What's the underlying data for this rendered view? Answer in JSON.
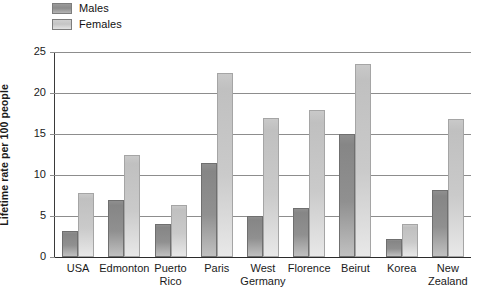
{
  "legend": {
    "position": "top-left",
    "items": [
      {
        "label": "Males",
        "color": "#8c8c8c",
        "icon": "legend-swatch-icon"
      },
      {
        "label": "Females",
        "color": "#c8c8c8",
        "icon": "legend-swatch-icon"
      }
    ]
  },
  "axis": {
    "ylabel": "Lifetime rate per 100 people",
    "yticks": [
      "0",
      "5",
      "10",
      "15",
      "20",
      "25"
    ]
  },
  "chart_data": {
    "type": "bar",
    "title": "",
    "xlabel": "",
    "ylabel": "Lifetime rate per 100 people",
    "ylim": [
      0,
      25
    ],
    "yticks": [
      0,
      5,
      10,
      15,
      20,
      25
    ],
    "grid": true,
    "legend_position": "top-left",
    "categories": [
      "USA",
      "Edmonton",
      "Puerto\nRico",
      "Paris",
      "West\nGermany",
      "Florence",
      "Beirut",
      "Korea",
      "New\nZealand"
    ],
    "series": [
      {
        "name": "Males",
        "color": "#8c8c8c",
        "values": [
          3.2,
          7.0,
          4.0,
          11.5,
          5.0,
          6.0,
          15.0,
          2.2,
          8.2
        ]
      },
      {
        "name": "Females",
        "color": "#c8c8c8",
        "values": [
          7.8,
          12.4,
          6.3,
          22.5,
          17.0,
          17.9,
          23.5,
          4.0,
          16.8
        ]
      }
    ]
  }
}
